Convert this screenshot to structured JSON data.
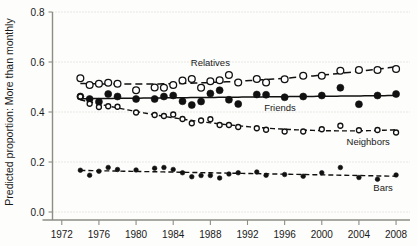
{
  "chart_data": {
    "type": "scatter",
    "title": "",
    "xlabel": "",
    "ylabel": "Predicted proportion: More than monthly",
    "xlim": [
      1971,
      2009.5
    ],
    "ylim": [
      0.0,
      0.8
    ],
    "grid": true,
    "legend_position": "inline-annotations",
    "xticks": [
      1972,
      1976,
      1980,
      1984,
      1988,
      1992,
      1996,
      2000,
      2004,
      2008
    ],
    "xtick_labels": [
      "1972",
      "1976",
      "1980",
      "1984",
      "1988",
      "1992",
      "1996",
      "2000",
      "2004",
      "2008"
    ],
    "yticks": [
      0.0,
      0.2,
      0.4,
      0.6,
      0.8
    ],
    "ytick_labels": [
      "0.0",
      "0.2",
      "0.4",
      "0.6",
      "0.8"
    ],
    "annotations": [
      {
        "text": "Relatives",
        "x": 1988.0,
        "y": 0.585
      },
      {
        "text": "Friends",
        "x": 1995.5,
        "y": 0.405
      },
      {
        "text": "Neighbors",
        "x": 2005.0,
        "y": 0.268
      },
      {
        "text": "Bars",
        "x": 2006.6,
        "y": 0.083
      }
    ],
    "series": [
      {
        "name": "Relatives",
        "marker": "open-circle",
        "linestyle": "dashed-long",
        "x": [
          1974,
          1975,
          1976,
          1977,
          1978,
          1980,
          1982,
          1983,
          1984,
          1985,
          1986,
          1987,
          1988,
          1989,
          1990,
          1991,
          1993,
          1994,
          1996,
          1998,
          2000,
          2002,
          2004,
          2006,
          2008
        ],
        "values": [
          0.535,
          0.508,
          0.513,
          0.517,
          0.513,
          0.487,
          0.498,
          0.497,
          0.508,
          0.526,
          0.532,
          0.497,
          0.523,
          0.527,
          0.548,
          0.518,
          0.532,
          0.518,
          0.531,
          0.545,
          0.545,
          0.565,
          0.568,
          0.568,
          0.572
        ]
      },
      {
        "name": "Friends",
        "marker": "filled-circle",
        "linestyle": "solid",
        "x": [
          1974,
          1975,
          1976,
          1977,
          1978,
          1980,
          1982,
          1983,
          1984,
          1985,
          1986,
          1987,
          1988,
          1989,
          1990,
          1991,
          1993,
          1994,
          1996,
          1998,
          2000,
          2002,
          2004,
          2006,
          2008
        ],
        "values": [
          0.462,
          0.452,
          0.441,
          0.472,
          0.462,
          0.452,
          0.452,
          0.462,
          0.466,
          0.443,
          0.428,
          0.442,
          0.474,
          0.487,
          0.449,
          0.432,
          0.47,
          0.469,
          0.459,
          0.462,
          0.466,
          0.497,
          0.431,
          0.466,
          0.472
        ]
      },
      {
        "name": "Neighbors",
        "marker": "open-circle",
        "linestyle": "dashed-mid",
        "x": [
          1974,
          1975,
          1976,
          1977,
          1978,
          1980,
          1982,
          1983,
          1984,
          1985,
          1986,
          1987,
          1988,
          1989,
          1990,
          1991,
          1993,
          1994,
          1996,
          1998,
          2000,
          2002,
          2004,
          2006,
          2008
        ],
        "values": [
          0.462,
          0.433,
          0.42,
          0.423,
          0.421,
          0.398,
          0.388,
          0.384,
          0.39,
          0.372,
          0.355,
          0.366,
          0.371,
          0.348,
          0.348,
          0.34,
          0.335,
          0.329,
          0.322,
          0.322,
          0.331,
          0.345,
          0.327,
          0.328,
          0.318
        ]
      },
      {
        "name": "Bars",
        "marker": "filled-circle",
        "linestyle": "dashed-mid",
        "x": [
          1974,
          1975,
          1976,
          1977,
          1978,
          1980,
          1982,
          1983,
          1984,
          1985,
          1986,
          1987,
          1988,
          1989,
          1990,
          1991,
          1993,
          1994,
          1996,
          1998,
          2000,
          2002,
          2004,
          2006,
          2008
        ],
        "values": [
          0.167,
          0.147,
          0.163,
          0.178,
          0.17,
          0.168,
          0.175,
          0.178,
          0.17,
          0.157,
          0.141,
          0.146,
          0.146,
          0.136,
          0.152,
          0.157,
          0.16,
          0.147,
          0.15,
          0.143,
          0.157,
          0.178,
          0.138,
          0.131,
          0.148
        ]
      }
    ]
  }
}
